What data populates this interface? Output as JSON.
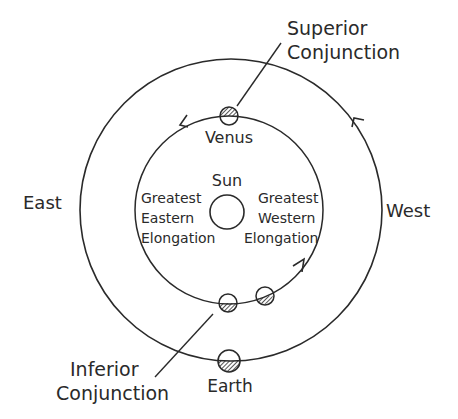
{
  "diagram": {
    "labels": {
      "superior_line1": "Superior",
      "superior_line2": "Conjunction",
      "venus": "Venus",
      "sun": "Sun",
      "east": "East",
      "west": "West",
      "gee_line1": "Greatest",
      "gee_line2": "Eastern",
      "gee_line3": "Elongation",
      "gwe_line1": "Greatest",
      "gwe_line2": "Western",
      "gwe_line3": "Elongation",
      "inferior_line1": "Inferior",
      "inferior_line2": "Conjunction",
      "earth": "Earth"
    },
    "colors": {
      "stroke": "#2a2a2a",
      "background": "#ffffff"
    }
  }
}
